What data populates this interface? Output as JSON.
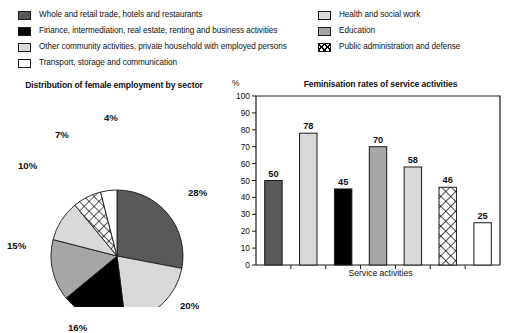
{
  "legend": {
    "left_items": [
      {
        "label": "Whole and retail trade, hotels and restaurants",
        "swatch": "dark-gray",
        "color": "#58595b"
      },
      {
        "label": "Finance, intermediation, real estate, renting and business activities",
        "swatch": "black",
        "color": "#000000"
      },
      {
        "label": "Other community activities, private household with employed persons",
        "swatch": "light-gray",
        "color": "#d9d9d9"
      },
      {
        "label": "Transport, storage and communication",
        "swatch": "white",
        "color": "#ffffff"
      }
    ],
    "right_items": [
      {
        "label": "Health and social work",
        "swatch": "light-gray",
        "color": "#d9d9d9"
      },
      {
        "label": "Education",
        "swatch": "mid-gray",
        "color": "#a6a6a6"
      },
      {
        "label": "Public administration and defense",
        "swatch": "hatch",
        "color": "#000000"
      }
    ]
  },
  "chart_data": [
    {
      "type": "pie",
      "title": "Distribution of female employment by sector",
      "xlabel": "",
      "ylabel": "",
      "legend_position": "top",
      "categories": [
        "Whole and retail trade, hotels and restaurants",
        "Health and social work",
        "Finance, intermediation, real estate, renting and business activities",
        "Education",
        "Other community activities, private household with employed persons",
        "Public administration and defense",
        "Transport, storage and communication"
      ],
      "values": [
        28,
        20,
        16,
        15,
        10,
        7,
        4
      ],
      "labels": [
        "28%",
        "20%",
        "16%",
        "15%",
        "10%",
        "7%",
        "4%"
      ],
      "colors": [
        "#58595b",
        "#d9d9d9",
        "#000000",
        "#a6a6a6",
        "#d9d9d9",
        "hatch",
        "#ffffff"
      ],
      "start_angle_deg": 0,
      "direction": "clockwise"
    },
    {
      "type": "bar",
      "title": "Feminisation rates of service activities",
      "xlabel": "Service activities",
      "ylabel": "%",
      "unit": "%",
      "categories": [
        "Whole and retail trade, hotels and restaurants",
        "Health and social work",
        "Finance, intermediation, real estate, renting and business activities",
        "Education",
        "Other community activities, private household with employed persons",
        "Public administration and defense",
        "Transport, storage and communication"
      ],
      "values": [
        50,
        78,
        45,
        70,
        58,
        46,
        25
      ],
      "colors": [
        "#58595b",
        "#d9d9d9",
        "#000000",
        "#a6a6a6",
        "#d9d9d9",
        "hatch",
        "#ffffff"
      ],
      "ylim": [
        0,
        100
      ],
      "yticks": [
        0,
        10,
        20,
        30,
        40,
        50,
        60,
        70,
        80,
        90,
        100
      ],
      "grid": false,
      "legend_position": "top"
    }
  ]
}
